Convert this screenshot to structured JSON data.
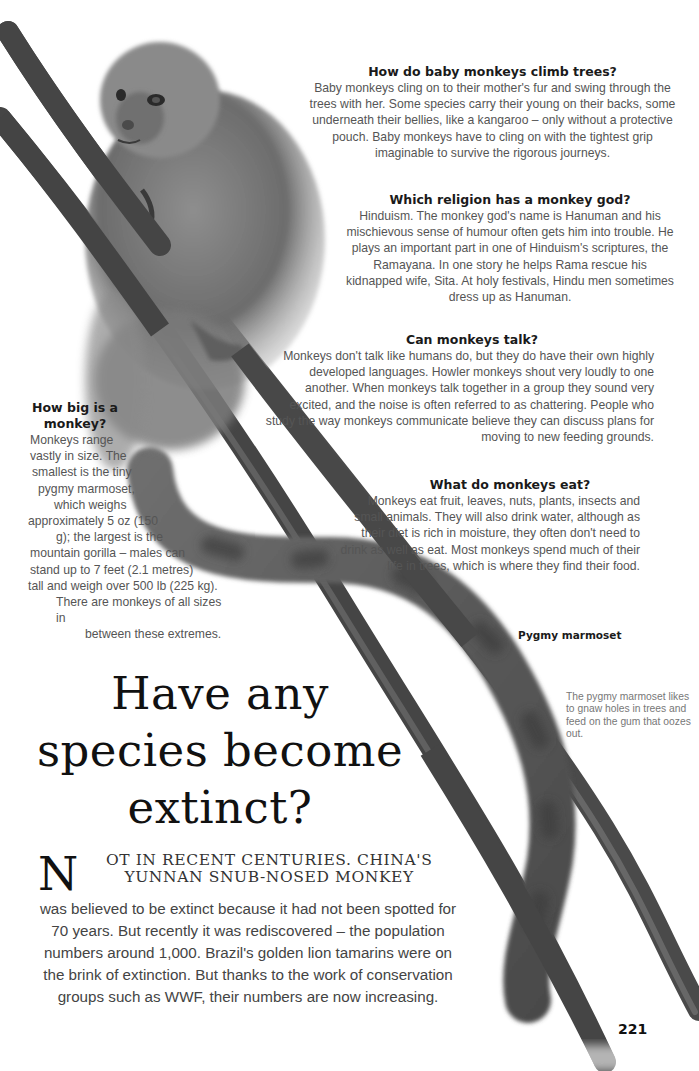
{
  "page": {
    "number": "221"
  },
  "qa": {
    "climb": {
      "question": "How do baby monkeys climb trees?",
      "answer": "Baby monkeys cling on to their mother's fur and swing through the trees with her. Some species carry their young on their backs, some underneath their bellies, like a kangaroo – only without a protective pouch. Baby monkeys have to cling on with the tightest grip imaginable to survive the rigorous journeys."
    },
    "religion": {
      "question": "Which religion has a monkey god?",
      "answer": "Hinduism. The monkey god's name is Hanuman and his mischievous sense of humour often gets him into trouble. He plays an important part in one of Hinduism's scriptures, the Ramayana. In one story he helps Rama rescue his kidnapped wife, Sita. At holy festivals, Hindu men sometimes dress up as Hanuman."
    },
    "talk": {
      "question": "Can monkeys talk?",
      "answer": "Monkeys don't talk like humans do, but they do have their own highly developed languages. Howler monkeys shout very loudly to one another. When monkeys talk together in a group they sound very excited, and the noise is often referred to as chattering. People who study the way monkeys communicate believe they can discuss plans for moving to new feeding grounds."
    },
    "eat": {
      "question": "What do monkeys eat?",
      "answer": "Monkeys eat fruit, leaves, nuts, plants, insects and small animals. They will also drink water, although as their diet is rich in moisture, they often don't need to drink as well as eat. Most monkeys spend much of their life in trees, which is where they find their food."
    },
    "big": {
      "question": "How big is a monkey?",
      "answer_lines": [
        "Monkeys range",
        "vastly in size. The",
        "smallest is the tiny",
        "pygmy marmoset,",
        "which weighs",
        "approximately 5 oz (150",
        "g); the largest is the",
        "mountain gorilla – males can",
        "stand up to 7 feet (2.1 metres)",
        "tall and weigh over 500 lb (225 kg).",
        "There are monkeys of all sizes in",
        "between these extremes."
      ]
    }
  },
  "image": {
    "subject": "pygmy-marmoset-on-branches",
    "caption_label": "Pygmy marmoset",
    "caption_text": "The pygmy marmoset likes to gnaw holes in trees and feed on the gum that oozes out."
  },
  "feature": {
    "headline_lines": [
      "Have any",
      "species become",
      "extinct?"
    ],
    "dropcap": "N",
    "lead_caps_line1": "OT IN RECENT CENTURIES. CHINA'S",
    "lead_caps_line2": "YUNNAN SNUB-NOSED MONKEY",
    "body": "was believed to be extinct because it had not been spotted for 70 years. But recently it was rediscovered – the population numbers around 1,000. Brazil's golden lion tamarins were on the brink of extinction. But thanks to the work of conservation groups such as WWF, their numbers are now increasing."
  },
  "colors": {
    "background": "#ffffff",
    "heading": "#1a1a1a",
    "body_text": "#555555",
    "caption_text": "#777777",
    "branch": "#4a4a4a",
    "fur": "#7a7a7a"
  }
}
